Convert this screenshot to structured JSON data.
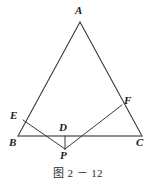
{
  "figure": {
    "caption": "图 2 － 12",
    "stroke_color": "#3a3a3a",
    "baseline_color": "#6b6b6b",
    "label_color": "#1b1b1b",
    "background": "#ffffff"
  },
  "labels": {
    "A": "A",
    "B": "B",
    "C": "C",
    "D": "D",
    "E": "E",
    "F": "F",
    "P": "P"
  },
  "geometry": {
    "points": {
      "A": {
        "x": 80,
        "y": 22
      },
      "B": {
        "x": 18,
        "y": 136
      },
      "C": {
        "x": 142,
        "y": 136
      },
      "D": {
        "x": 65,
        "y": 136
      },
      "E": {
        "x": 23,
        "y": 120
      },
      "F": {
        "x": 122,
        "y": 105
      },
      "P": {
        "x": 65,
        "y": 149
      }
    },
    "segments": [
      {
        "name": "side-AB",
        "from": "A",
        "to": "B"
      },
      {
        "name": "side-AC",
        "from": "A",
        "to": "C"
      },
      {
        "name": "side-BC",
        "from": "B",
        "to": "C"
      },
      {
        "name": "segment-EP",
        "from": "E",
        "to": "P"
      },
      {
        "name": "segment-PF",
        "from": "P",
        "to": "F"
      },
      {
        "name": "segment-DP",
        "from": "D",
        "to": "P"
      }
    ]
  }
}
